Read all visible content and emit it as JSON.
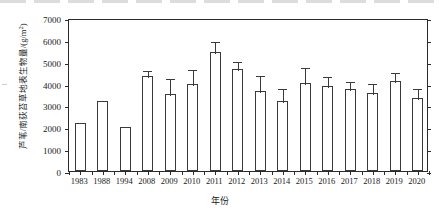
{
  "chart_data": {
    "type": "bar",
    "title": "",
    "xlabel": "年份",
    "ylabel": "芦苇/南荻苔草地表生物量/(g/m²)",
    "ylabel_main": "芦苇/南荻苔草地表生物量/(g/m",
    "ylabel_sup": "2",
    "ylabel_tail": ")",
    "ylim": [
      0,
      7000
    ],
    "ytick_step": 1000,
    "yticks": [
      "0",
      "1000",
      "2000",
      "3000",
      "4000",
      "5000",
      "6000",
      "7000"
    ],
    "grid": false,
    "legend": "none",
    "error_bars": "upper only (mean + SD)",
    "categories": [
      "1983",
      "1988",
      "1994",
      "2008",
      "2009",
      "2010",
      "2011",
      "2012",
      "2013",
      "2014",
      "2015",
      "2016",
      "2017",
      "2018",
      "2019",
      "2020"
    ],
    "values": [
      2210,
      3220,
      2020,
      4330,
      3510,
      3990,
      5450,
      4680,
      3680,
      3200,
      4020,
      3870,
      3750,
      3570,
      4100,
      3320
    ],
    "errors_upper": [
      null,
      null,
      null,
      4650,
      4280,
      4720,
      6000,
      5080,
      4440,
      3830,
      4800,
      4400,
      4170,
      4080,
      4570,
      3830
    ],
    "series": [
      {
        "name": "芦苇/南荻苔草地表生物量",
        "values": [
          2210,
          3220,
          2020,
          4330,
          3510,
          3990,
          5450,
          4680,
          3680,
          3200,
          4020,
          3870,
          3750,
          3570,
          4100,
          3320
        ]
      }
    ],
    "colors": {
      "bar_fill": "#ffffff",
      "bar_stroke": "#3a3a3a",
      "axis": "#2b2b2b",
      "text": "#1a1a1a"
    }
  }
}
